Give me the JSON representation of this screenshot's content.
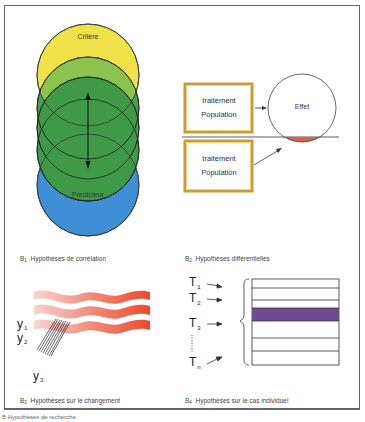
{
  "figure": {
    "footer_caption": "B   Hypothèses de recherche",
    "panels": [
      {
        "id": "B1",
        "caption_prefix": "B",
        "caption_sub": "1",
        "caption": "Hypothèses de corrélation",
        "labels": {
          "top_circle": "Critère",
          "bottom_circle": "Prédicteur"
        },
        "colors": {
          "top": "#f2e24a",
          "mid_light": "#7fbf4a",
          "mid": "#3f9a48",
          "bottom": "#3f8fd6"
        }
      },
      {
        "id": "B2",
        "caption_prefix": "B",
        "caption_sub": "2",
        "caption": "Hypothèses différentielles",
        "boxes": [
          {
            "line1": "traitement",
            "line2": "Population"
          },
          {
            "line1": "traitement",
            "line2": "Population"
          }
        ],
        "effect_label": "Effet",
        "colors": {
          "box_border": "#d9b24a",
          "effect_segment": "#d9614f"
        }
      },
      {
        "id": "B3",
        "caption_prefix": "B",
        "caption_sub": "3",
        "caption": "Hypothèses sur le changement",
        "y_labels": [
          {
            "base": "y",
            "sub": "1"
          },
          {
            "base": "y",
            "sub": "2"
          },
          {
            "base": "y",
            "sub": "3"
          }
        ],
        "colors": {
          "wave_start": "#f7c9c3",
          "wave_end": "#ee4a2c"
        }
      },
      {
        "id": "B4",
        "caption_prefix": "B",
        "caption_sub": "4",
        "caption": "Hypothèses sur le cas individuel",
        "t_labels": [
          {
            "base": "T",
            "sub": "1"
          },
          {
            "base": "T",
            "sub": "2"
          },
          {
            "base": "T",
            "sub": "3"
          },
          {
            "base": "T",
            "sub": "n"
          }
        ],
        "colors": {
          "highlight_row": "#6e4a8e"
        }
      }
    ]
  }
}
